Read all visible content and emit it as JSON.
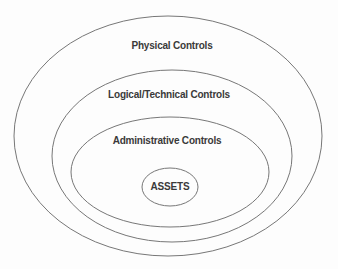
{
  "diagram": {
    "type": "concentric-ellipses",
    "layers": [
      {
        "label": "Physical Controls"
      },
      {
        "label": "Logical/Technical Controls"
      },
      {
        "label": "Administrative Controls"
      },
      {
        "label": "ASSETS"
      }
    ],
    "colors": {
      "stroke": "#777777",
      "text": "#3a3a3a",
      "background": "#fdfdfd"
    }
  }
}
